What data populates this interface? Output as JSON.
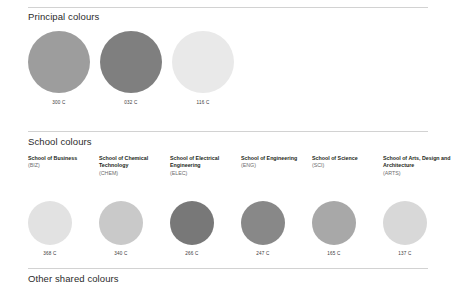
{
  "sections": {
    "principal": {
      "title": "Principal colours",
      "swatches": [
        {
          "code": "300 C",
          "color": "#9d9d9d",
          "left": 0
        },
        {
          "code": "032 C",
          "color": "#7f7f7f",
          "left": 72
        },
        {
          "code": "116 C",
          "color": "#e9e9e9",
          "left": 144
        }
      ]
    },
    "school": {
      "title": "School colours",
      "swatches": [
        {
          "name": "School of Business",
          "abbr": "(BIZ)",
          "code": "368 C",
          "color": "#e2e2e2",
          "left": 0
        },
        {
          "name": "School of Chemical Technology",
          "abbr": "(CHEM)",
          "code": "340 C",
          "color": "#c9c9c9",
          "left": 71
        },
        {
          "name": "School of Electrical Engineering",
          "abbr": "(ELEC)",
          "code": "266 C",
          "color": "#787878",
          "left": 142
        },
        {
          "name": "School of Engineering",
          "abbr": "(ENG)",
          "code": "247 C",
          "color": "#888888",
          "left": 213
        },
        {
          "name": "School of Science",
          "abbr": "(SCI)",
          "code": "165 C",
          "color": "#a8a8a8",
          "left": 284
        },
        {
          "name": "School of Arts, Design and Architecture",
          "abbr": "(ARTS)",
          "code": "137 C",
          "color": "#d8d8d8",
          "left": 355
        }
      ]
    },
    "other": {
      "title": "Other shared colours"
    }
  }
}
